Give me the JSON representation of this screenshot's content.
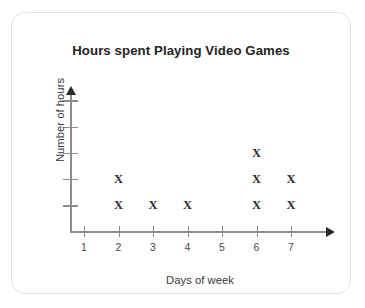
{
  "card": {
    "border_color": "#e2e2e2",
    "background": "#ffffff"
  },
  "chart_data": {
    "type": "scatter",
    "plot_style": "dot-plot-with-x-markers",
    "title": "Hours spent Playing Video Games",
    "xlabel": "Days of week",
    "ylabel": "Number of hours",
    "marker": "X",
    "marker_color": "#2e2e2e",
    "axis_color": "#8c8c8c",
    "grid": false,
    "legend": null,
    "categories": [
      "1",
      "2",
      "3",
      "4",
      "5",
      "6",
      "7"
    ],
    "x": [
      1,
      2,
      3,
      4,
      5,
      6,
      7
    ],
    "values": [
      0,
      2,
      1,
      1,
      0,
      3,
      2
    ],
    "xlim": [
      0,
      8
    ],
    "ylim": [
      0,
      5
    ],
    "x_tick_labels": [
      "1",
      "2",
      "3",
      "4",
      "5",
      "6",
      "7"
    ],
    "y_tick_labels": [
      "",
      "",
      "",
      "",
      ""
    ],
    "y_tick_count": 5,
    "points": [
      {
        "day": 2,
        "level": 1
      },
      {
        "day": 2,
        "level": 2
      },
      {
        "day": 3,
        "level": 1
      },
      {
        "day": 4,
        "level": 1
      },
      {
        "day": 6,
        "level": 1
      },
      {
        "day": 6,
        "level": 2
      },
      {
        "day": 6,
        "level": 3
      },
      {
        "day": 7,
        "level": 1
      },
      {
        "day": 7,
        "level": 2
      }
    ]
  }
}
